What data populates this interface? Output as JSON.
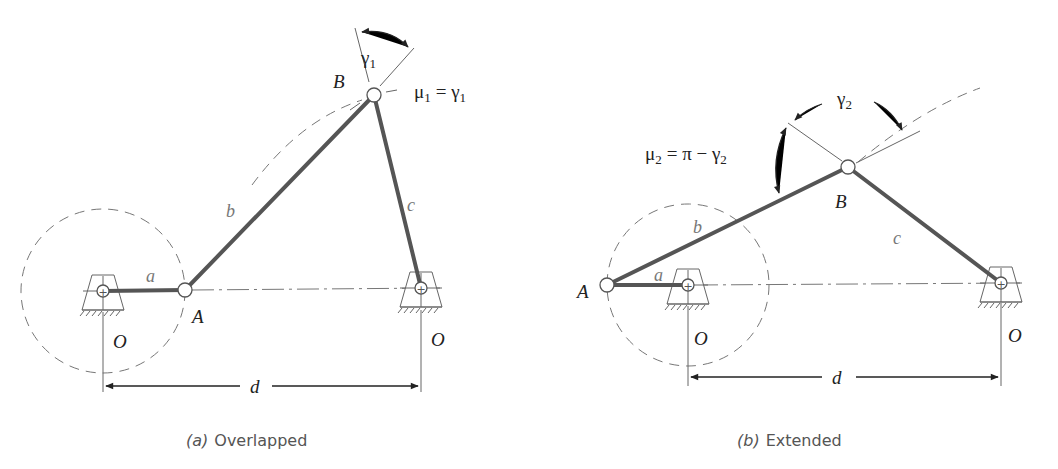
{
  "panels": [
    {
      "id": "a",
      "caption_letter": "(a)",
      "caption_text": "Overlapped",
      "labels": {
        "A": "A",
        "B": "B",
        "O_left": "O",
        "O_right": "O",
        "a": "a",
        "b": "b",
        "c": "c",
        "d": "d"
      },
      "angle_label": "γ",
      "angle_sub": "1",
      "equation": {
        "mu": "μ",
        "mu_sub": "1",
        "rhs": "= γ",
        "rhs_sub": "1"
      }
    },
    {
      "id": "b",
      "caption_letter": "(b)",
      "caption_text": "Extended",
      "labels": {
        "A": "A",
        "B": "B",
        "O_left": "O",
        "O_right": "O",
        "a": "a",
        "b": "b",
        "c": "c",
        "d": "d"
      },
      "angle_label": "γ",
      "angle_sub": "2",
      "equation": {
        "mu": "μ",
        "mu_sub": "2",
        "rhs": "= π − γ",
        "rhs_sub": "2"
      }
    }
  ],
  "colors": {
    "link": "#555555",
    "construction": "#777777",
    "text": "#222222",
    "caption": "#555555"
  }
}
